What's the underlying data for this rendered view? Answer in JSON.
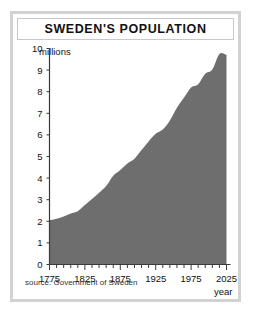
{
  "figure": {
    "title": "SWEDEN'S POPULATION",
    "source": "source: Government of Sweden",
    "units_label": "millions",
    "frame_color": "#d2d2d2",
    "area_color": "#6e6e6e",
    "text_color": "#111111"
  },
  "chart_data": {
    "type": "area",
    "title": "SWEDEN'S POPULATION",
    "xlabel": "year",
    "ylabel": "millions",
    "xlim": [
      1775,
      2025
    ],
    "ylim": [
      0,
      10
    ],
    "grid": false,
    "legend": null,
    "x_ticks": [
      1775,
      1825,
      1875,
      1925,
      1975,
      2025
    ],
    "x_tick_labels": [
      "1775",
      "1825",
      "1875",
      "1925",
      "1975",
      "2025"
    ],
    "x_minor_tick_step": 10,
    "y_ticks": [
      0,
      1,
      2,
      3,
      4,
      5,
      6,
      7,
      8,
      9,
      10
    ],
    "y_tick_labels": [
      "0",
      "1",
      "2",
      "3",
      "4",
      "5",
      "6",
      "7",
      "8",
      "9",
      "10"
    ],
    "series": [
      {
        "name": "Population (millions)",
        "x": [
          1775,
          1785,
          1795,
          1805,
          1815,
          1825,
          1835,
          1845,
          1855,
          1865,
          1875,
          1885,
          1895,
          1905,
          1915,
          1925,
          1935,
          1945,
          1955,
          1965,
          1975,
          1985,
          1995,
          2005,
          2015,
          2025
        ],
        "values": [
          2.05,
          2.12,
          2.22,
          2.36,
          2.47,
          2.75,
          3.03,
          3.32,
          3.63,
          4.11,
          4.38,
          4.68,
          4.9,
          5.3,
          5.7,
          6.05,
          6.25,
          6.67,
          7.26,
          7.73,
          8.2,
          8.35,
          8.83,
          9.03,
          9.75,
          9.7
        ],
        "color": "#6e6e6e"
      }
    ],
    "annotations": []
  }
}
